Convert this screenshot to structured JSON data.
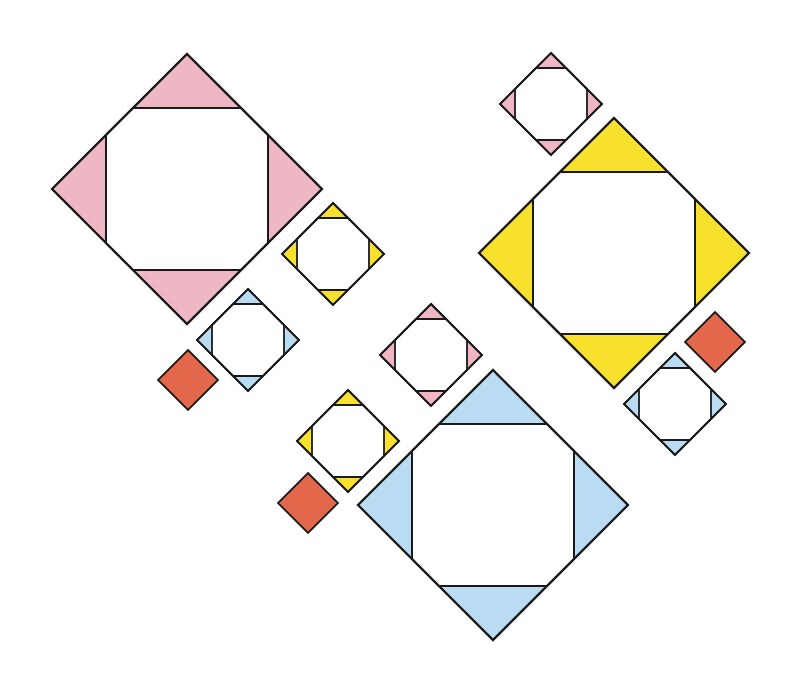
{
  "colors": {
    "pink": "#efb6c4",
    "yellow": "#f8e12c",
    "blue": "#b9dcf2",
    "red": "#e3684b",
    "stroke": "#1a1a1a",
    "inner": "#ffffff"
  },
  "shapes": [
    {
      "id": "big-pink",
      "type": "octagon-tile",
      "color": "pink",
      "cx": 187,
      "cy": 189,
      "half": 135,
      "cut": 54
    },
    {
      "id": "big-yellow",
      "type": "octagon-tile",
      "color": "yellow",
      "cx": 614,
      "cy": 253,
      "half": 135,
      "cut": 54
    },
    {
      "id": "big-blue",
      "type": "octagon-tile",
      "color": "blue",
      "cx": 493,
      "cy": 505,
      "half": 135,
      "cut": 54
    },
    {
      "id": "small-pink-top",
      "type": "octagon-tile",
      "color": "pink",
      "cx": 551,
      "cy": 104,
      "half": 51,
      "cut": 15
    },
    {
      "id": "small-yellow-upper",
      "type": "octagon-tile",
      "color": "yellow",
      "cx": 333,
      "cy": 254,
      "half": 51,
      "cut": 15
    },
    {
      "id": "small-blue-left",
      "type": "octagon-tile",
      "color": "blue",
      "cx": 248,
      "cy": 340,
      "half": 51,
      "cut": 15
    },
    {
      "id": "small-pink-mid",
      "type": "octagon-tile",
      "color": "pink",
      "cx": 431,
      "cy": 355,
      "half": 51,
      "cut": 15
    },
    {
      "id": "small-yellow-lower",
      "type": "octagon-tile",
      "color": "yellow",
      "cx": 348,
      "cy": 441,
      "half": 51,
      "cut": 15
    },
    {
      "id": "small-blue-right",
      "type": "octagon-tile",
      "color": "blue",
      "cx": 675,
      "cy": 404,
      "half": 51,
      "cut": 15
    },
    {
      "id": "red-left",
      "type": "square",
      "color": "red",
      "cx": 188,
      "cy": 380,
      "half": 30
    },
    {
      "id": "red-mid",
      "type": "square",
      "color": "red",
      "cx": 308,
      "cy": 503,
      "half": 30
    },
    {
      "id": "red-right",
      "type": "square",
      "color": "red",
      "cx": 715,
      "cy": 342,
      "half": 30
    }
  ]
}
